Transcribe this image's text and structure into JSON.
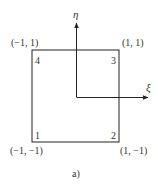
{
  "figure": {
    "caption": "a)",
    "axes": {
      "vertical_label": "η",
      "horizontal_label": "ξ"
    },
    "nodes": [
      {
        "number": "1",
        "coords": "(−1, −1)"
      },
      {
        "number": "2",
        "coords": "(1, −1)"
      },
      {
        "number": "3",
        "coords": "(1, 1)"
      },
      {
        "number": "4",
        "coords": "(−1, 1)"
      }
    ],
    "colors": {
      "line": "#222222",
      "text": "#333333"
    }
  }
}
